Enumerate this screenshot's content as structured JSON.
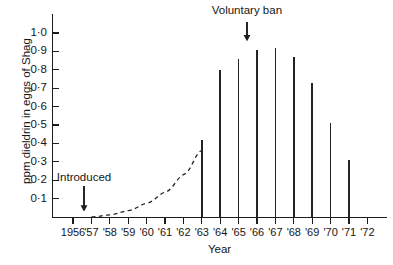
{
  "chart_data": {
    "type": "bar",
    "title": "",
    "xlabel": "Year",
    "ylabel": "ppm dieldrin in eggs of Shag",
    "categories": [
      "1956",
      "'57",
      "'58",
      "'59",
      "'60",
      "'61",
      "'62",
      "'63",
      "'64",
      "'65",
      "'66",
      "'67",
      "'68",
      "'69",
      "'70",
      "'71",
      "'72"
    ],
    "values": [
      0,
      0,
      0,
      0,
      0,
      0,
      0,
      0.42,
      0.8,
      0.86,
      0.91,
      0.92,
      0.87,
      0.73,
      0.51,
      0.31,
      0
    ],
    "ylim": [
      0,
      1.05
    ],
    "ytick_values": [
      0.1,
      0.2,
      0.3,
      0.4,
      0.5,
      0.6,
      0.7,
      0.8,
      0.9,
      1.0
    ],
    "ytick_labels": [
      "0·1",
      "0·2",
      "0·3",
      "0·4",
      "0·5",
      "0·6",
      "0·7",
      "0·8",
      "0·9",
      "1·0"
    ],
    "grid": false,
    "legend": false,
    "series_color": "#242424",
    "axis_color": "#1c1c1c",
    "background_color": "#ffffff",
    "trend_curve": {
      "style": "dashed",
      "label": "extrapolated rise",
      "points": [
        [
          1957.0,
          0.0
        ],
        [
          1958.0,
          0.012
        ],
        [
          1959.0,
          0.035
        ],
        [
          1960.0,
          0.075
        ],
        [
          1961.0,
          0.135
        ],
        [
          1962.0,
          0.23
        ],
        [
          1962.95,
          0.36
        ]
      ]
    },
    "annotations": [
      {
        "id": "introduced",
        "text": "Introduced",
        "x_year": 1956.6,
        "label_y_value": 0.21,
        "arrow_from_value": 0.17,
        "arrow_to_value": 0.03
      },
      {
        "id": "voluntary-ban",
        "text": "Voluntary ban",
        "x_year": 1965.45,
        "label_y_value": 1.12,
        "arrow_from_value": 1.06,
        "arrow_to_value": 0.955
      }
    ]
  }
}
